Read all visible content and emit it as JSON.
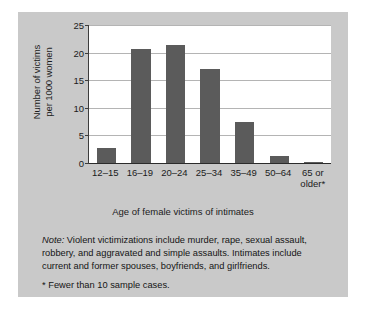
{
  "figure": {
    "background_color": "#c9c9c9",
    "plot_background_color": "#ffffff",
    "bar_color": "#5b5b5b"
  },
  "notes": {
    "note_label": "Note:",
    "note_text": " Violent victimizations include murder, rape, sexual assault, robbery, and aggravated and simple assaults. Intimates include current and former spouses, boyfriends, and girlfriends.",
    "footnote": "* Fewer than 10 sample cases."
  },
  "chart_data": {
    "type": "bar",
    "title": "",
    "xlabel": "Age of female victims of intimates",
    "ylabel_line1": "Number of victims",
    "ylabel_line2": "per 1000 women",
    "categories": [
      "12–15",
      "16–19",
      "20–24",
      "25–34",
      "35–49",
      "50–64",
      "65 or\nolder*"
    ],
    "values": [
      2.8,
      20.6,
      21.3,
      17.0,
      7.4,
      1.2,
      0.2
    ],
    "ylim": [
      0,
      25
    ],
    "yticks": [
      0,
      5,
      10,
      15,
      20,
      25
    ],
    "ytick_labels": [
      "0",
      "5",
      "10",
      "15",
      "20",
      "25"
    ],
    "grid": true,
    "legend": "none"
  }
}
